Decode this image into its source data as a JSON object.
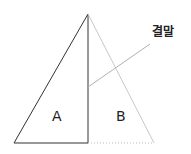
{
  "diagram": {
    "regions": [
      {
        "id": "A",
        "label": "A"
      },
      {
        "id": "B",
        "label": "B"
      }
    ],
    "callout": {
      "label": "결말"
    },
    "colors": {
      "solid_line": "#333333",
      "faint_line": "#c8c8c8"
    }
  }
}
